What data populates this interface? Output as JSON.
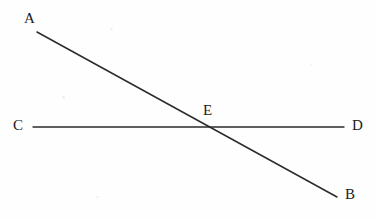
{
  "figure": {
    "type": "geometry-diagram",
    "width": 376,
    "height": 220,
    "background_color": "#fefefe",
    "stroke_color": "#2b2b2b",
    "label_color": "#1a1a1a",
    "stroke_width": 1.4
  },
  "points": [
    {
      "id": "A",
      "label": "A",
      "label_x": 24,
      "label_y": 11
    },
    {
      "id": "B",
      "label": "B",
      "label_x": 345,
      "label_y": 187
    },
    {
      "id": "C",
      "label": "C",
      "label_x": 13,
      "label_y": 118
    },
    {
      "id": "D",
      "label": "D",
      "label_x": 352,
      "label_y": 118
    },
    {
      "id": "E",
      "label": "E",
      "label_x": 203,
      "label_y": 103
    }
  ],
  "segments": [
    {
      "id": "AB",
      "from": "A",
      "to": "B",
      "x1": 37,
      "y1": 32,
      "x2": 337,
      "y2": 197
    },
    {
      "id": "CD",
      "from": "C",
      "to": "D",
      "x1": 33,
      "y1": 127,
      "x2": 344,
      "y2": 127
    }
  ],
  "intersection": {
    "id": "E",
    "x": 210,
    "y": 127
  }
}
